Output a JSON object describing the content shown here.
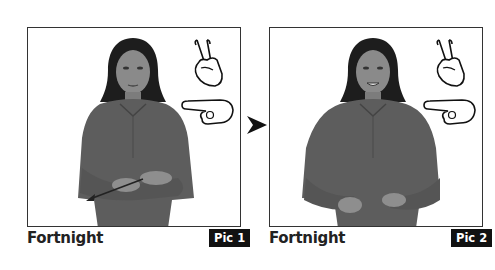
{
  "panels": [
    {
      "caption": "Fortnight",
      "badge": "Pic 1"
    },
    {
      "caption": "Fortnight",
      "badge": "Pic 2"
    }
  ],
  "icons": {
    "handshape_top": "v-handshape-icon",
    "handshape_bottom": "pointing-hand-icon",
    "sequence_arrow": "arrow-right-icon"
  },
  "colors": {
    "frame_border": "#333333",
    "badge_bg": "#111111",
    "badge_text": "#ffffff",
    "caption_text": "#222222"
  }
}
